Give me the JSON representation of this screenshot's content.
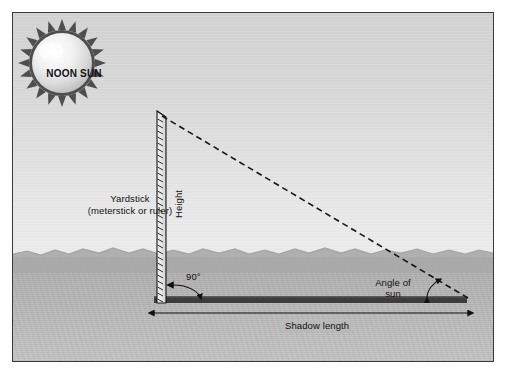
{
  "figure": {
    "background_sky_color": "#dcdcdc",
    "background_ground_color": "#b3b3b3",
    "frame_border_color": "#3a3a3a",
    "ink_color": "#111111"
  },
  "sun": {
    "label": "NOON SUN",
    "name": "noon-sun",
    "fill_color": "#e9e9e9",
    "corona_color": "#4a4a4a",
    "center_x": 61,
    "center_y": 62,
    "radius": 30
  },
  "yardstick": {
    "label_line1": "Yardstick",
    "label_line2": "(meterstick or ruler)",
    "height_label": "Height",
    "top_y": 110,
    "bottom_y": 302,
    "x": 155,
    "width": 9,
    "fill_color": "#e3e3e3",
    "edge_color": "#1a1a1a"
  },
  "shadow": {
    "label": "Shadow length",
    "bar_color": "#3d3d3d",
    "start_x": 150,
    "end_x": 465,
    "y": 298,
    "thickness": 7
  },
  "angles": {
    "right_angle_label": "90°",
    "sun_angle_label_line1": "Angle of",
    "sun_angle_label_line2": "sun"
  },
  "sun_ray": {
    "name": "sun-ray-dashed-line",
    "style": "dashed",
    "from_x": 160,
    "from_y": 116,
    "to_x": 466,
    "to_y": 298,
    "color": "#1a1a1a"
  },
  "dimension_arrow": {
    "name": "shadow-length-dimension",
    "left_x": 150,
    "right_x": 466,
    "y": 313,
    "double_headed": true
  }
}
